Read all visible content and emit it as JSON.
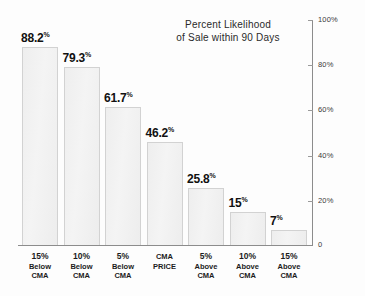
{
  "chart_data": {
    "type": "bar",
    "title": "Percent Likelihood of Sale within 90 Days",
    "title_line1": "Percent Likelihood",
    "title_line2": "of Sale within 90 Days",
    "xlabel": "",
    "ylabel": "",
    "ylim": [
      0,
      100
    ],
    "grid": false,
    "legend": "none",
    "categories": [
      "15% Below CMA",
      "10% Below CMA",
      "5% Below CMA",
      "CMA PRICE",
      "5% Above CMA",
      "10% Above CMA",
      "15% Above CMA"
    ],
    "category_lines": [
      [
        "15%",
        "Below",
        "CMA"
      ],
      [
        "10%",
        "Below",
        "CMA"
      ],
      [
        "5%",
        "Below",
        "CMA"
      ],
      [
        "CMA",
        "PRICE",
        ""
      ],
      [
        "5%",
        "Above",
        "CMA"
      ],
      [
        "10%",
        "Above",
        "CMA"
      ],
      [
        "15%",
        "Above",
        "CMA"
      ]
    ],
    "values": [
      88.2,
      79.3,
      61.7,
      46.2,
      25.8,
      15,
      7
    ],
    "value_labels": [
      "88.2",
      "79.3",
      "61.7",
      "46.2",
      "25.8",
      "15",
      "7"
    ],
    "value_suffix": "%",
    "yticks": [
      0,
      20,
      40,
      60,
      80,
      100
    ],
    "ytick_labels": [
      "0",
      "20%",
      "40%",
      "60%",
      "80%",
      "100%"
    ],
    "axis_position": "right",
    "bar_fill": "#f1f1f1",
    "bar_stroke": "#d2d2d2",
    "axis_color": "#8c8c8c",
    "text_color": "#111111",
    "background": "#fdfdfd"
  }
}
